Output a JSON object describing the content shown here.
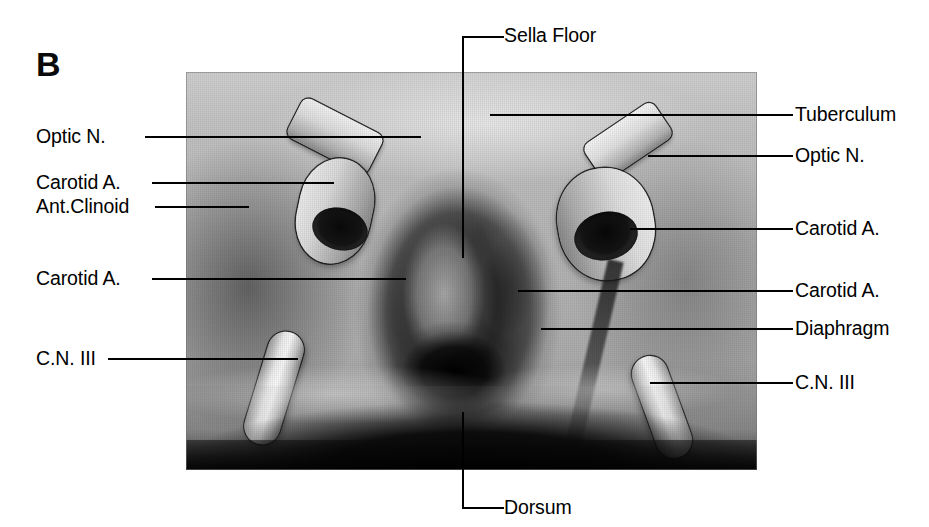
{
  "figure": {
    "panel_letter": "B",
    "caption_labels": {
      "top": "Sella Floor",
      "bottom": "Dorsum"
    }
  },
  "labels_left": [
    {
      "id": "optic-n-left",
      "text": "Optic N.",
      "y": 136
    },
    {
      "id": "carotid-a-left-1",
      "text": "Carotid A.",
      "y": 182
    },
    {
      "id": "ant-clinoid",
      "text": "Ant.Clinoid",
      "y": 206
    },
    {
      "id": "carotid-a-left-2",
      "text": "Carotid A.",
      "y": 278
    },
    {
      "id": "cn-iii-left",
      "text": "C.N. III",
      "y": 358
    }
  ],
  "labels_right": [
    {
      "id": "tuberculum",
      "text": "Tuberculum",
      "y": 114
    },
    {
      "id": "optic-n-right",
      "text": "Optic N.",
      "y": 155
    },
    {
      "id": "carotid-a-right-1",
      "text": "Carotid A.",
      "y": 228
    },
    {
      "id": "carotid-a-right-2",
      "text": "Carotid A.",
      "y": 290
    },
    {
      "id": "diaphragm",
      "text": "Diaphragm",
      "y": 328
    },
    {
      "id": "cn-iii-right",
      "text": "C.N. III",
      "y": 382
    }
  ],
  "colors": {
    "ink": "#000000",
    "page": "#ffffff",
    "specimen_mid": "#b9b5ae",
    "specimen_dark": "#191410",
    "specimen_light": "#e8e5df"
  }
}
